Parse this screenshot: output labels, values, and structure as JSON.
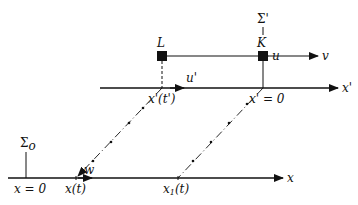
{
  "diagram": {
    "frames": {
      "rest": {
        "label": "Σ",
        "subscript": "o",
        "origin_label": "x = 0"
      },
      "moving": {
        "label": "Σ'",
        "origin_label": "x' = 0"
      }
    },
    "axes": {
      "lower": "x",
      "upper": "x'"
    },
    "objects": {
      "L": {
        "label": "L",
        "velocity_label": "u"
      },
      "K": {
        "label": "K",
        "velocity_label": "v"
      }
    },
    "velocity_labels": {
      "u_prime": "u'",
      "w": "w"
    },
    "positions": {
      "x_prime_t_prime": "x'(t')",
      "x_t": "x(t)",
      "x1_t": "x",
      "x1_sub": "1",
      "x1_arg": "(t)"
    }
  }
}
